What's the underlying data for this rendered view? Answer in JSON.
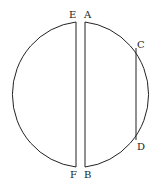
{
  "diagram": {
    "type": "geometric-figure",
    "labels": {
      "E": "E",
      "A": "A",
      "C": "C",
      "D": "D",
      "F": "F",
      "B": "B"
    },
    "stroke_color": "#222222",
    "background": "#ffffff"
  }
}
